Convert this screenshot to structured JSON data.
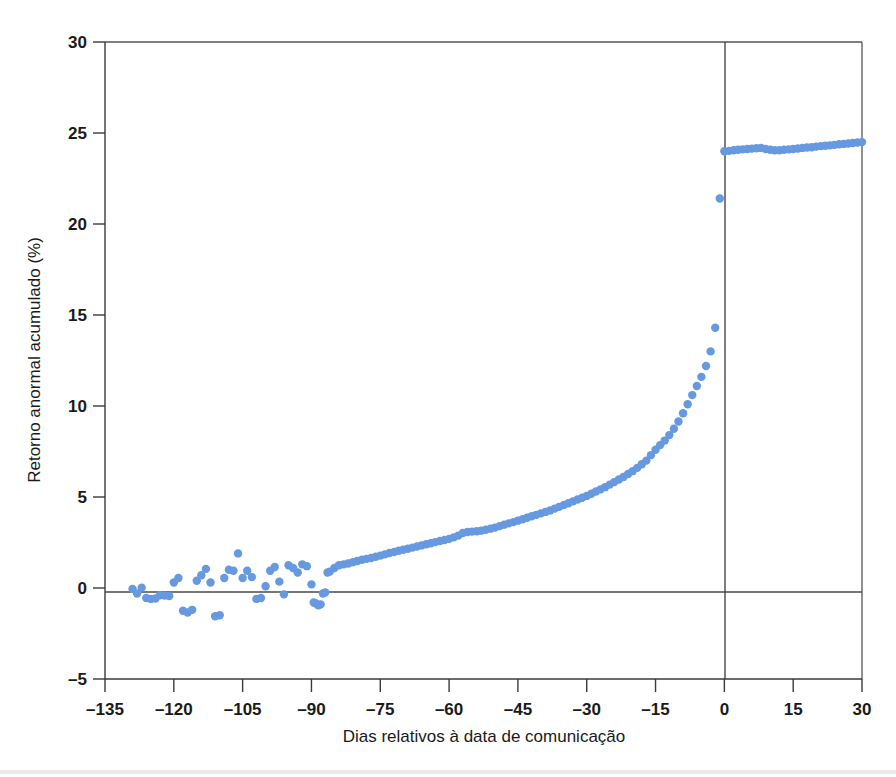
{
  "chart_data": {
    "type": "scatter",
    "title": "",
    "xlabel": "Dias relativos à data de comunicação",
    "ylabel": "Retorno anormal acumulado (%)",
    "xlim": [
      -135,
      30
    ],
    "ylim": [
      -5,
      30
    ],
    "xticks": [
      -135,
      -120,
      -105,
      -90,
      -75,
      -60,
      -45,
      -30,
      -15,
      0,
      15,
      30
    ],
    "xtick_labels": [
      "–135",
      "–120",
      "–105",
      "–90",
      "–75",
      "–60",
      "–45",
      "–30",
      "–15",
      "0",
      "15",
      "30"
    ],
    "yticks": [
      -5,
      0,
      5,
      10,
      15,
      20,
      25,
      30
    ],
    "ytick_labels": [
      "–5",
      "0",
      "5",
      "10",
      "15",
      "20",
      "25",
      "30"
    ],
    "grid": false,
    "legend": "none",
    "marker_color": "#6699e0",
    "marker_size": 4.2,
    "reference_lines": {
      "horizontal_zero_y": 0,
      "vertical_event_x": 0
    },
    "series": [
      {
        "name": "Retorno anormal acumulado",
        "points": [
          [
            -129,
            -0.05
          ],
          [
            -128,
            -0.3
          ],
          [
            -127,
            0.02
          ],
          [
            -126,
            -0.55
          ],
          [
            -125,
            -0.6
          ],
          [
            -124,
            -0.58
          ],
          [
            -123,
            -0.4
          ],
          [
            -122,
            -0.42
          ],
          [
            -121,
            -0.44
          ],
          [
            -120,
            0.3
          ],
          [
            -119,
            0.55
          ],
          [
            -118,
            -1.25
          ],
          [
            -117,
            -1.35
          ],
          [
            -116,
            -1.2
          ],
          [
            -115,
            0.4
          ],
          [
            -114,
            0.7
          ],
          [
            -113,
            1.05
          ],
          [
            -112,
            0.3
          ],
          [
            -111,
            -1.55
          ],
          [
            -110,
            -1.5
          ],
          [
            -109,
            0.55
          ],
          [
            -108,
            1.0
          ],
          [
            -107,
            0.95
          ],
          [
            -106,
            1.9
          ],
          [
            -105,
            0.55
          ],
          [
            -104,
            0.95
          ],
          [
            -103,
            0.6
          ],
          [
            -102,
            -0.6
          ],
          [
            -101,
            -0.55
          ],
          [
            -100,
            0.1
          ],
          [
            -99,
            0.95
          ],
          [
            -98,
            1.15
          ],
          [
            -97,
            0.35
          ],
          [
            -96,
            -0.35
          ],
          [
            -95,
            1.25
          ],
          [
            -94,
            1.1
          ],
          [
            -93,
            0.85
          ],
          [
            -92,
            1.3
          ],
          [
            -91,
            1.2
          ],
          [
            -90,
            0.2
          ],
          [
            -89.5,
            -0.8
          ],
          [
            -89,
            -0.85
          ],
          [
            -88.5,
            -0.95
          ],
          [
            -88,
            -0.9
          ],
          [
            -87.5,
            -0.3
          ],
          [
            -87,
            -0.25
          ],
          [
            -86.5,
            0.85
          ],
          [
            -86,
            0.9
          ],
          [
            -85,
            1.1
          ],
          [
            -84,
            1.25
          ],
          [
            -83,
            1.3
          ],
          [
            -82,
            1.35
          ],
          [
            -81,
            1.42
          ],
          [
            -80,
            1.48
          ],
          [
            -79,
            1.55
          ],
          [
            -78,
            1.6
          ],
          [
            -77,
            1.65
          ],
          [
            -76,
            1.72
          ],
          [
            -75,
            1.78
          ],
          [
            -74,
            1.85
          ],
          [
            -73,
            1.92
          ],
          [
            -72,
            1.98
          ],
          [
            -71,
            2.05
          ],
          [
            -70,
            2.1
          ],
          [
            -69,
            2.16
          ],
          [
            -68,
            2.22
          ],
          [
            -67,
            2.28
          ],
          [
            -66,
            2.34
          ],
          [
            -65,
            2.4
          ],
          [
            -64,
            2.46
          ],
          [
            -63,
            2.52
          ],
          [
            -62,
            2.58
          ],
          [
            -61,
            2.64
          ],
          [
            -60,
            2.7
          ],
          [
            -59,
            2.78
          ],
          [
            -58,
            2.88
          ],
          [
            -57,
            3.02
          ],
          [
            -56,
            3.08
          ],
          [
            -55,
            3.1
          ],
          [
            -54,
            3.12
          ],
          [
            -53,
            3.15
          ],
          [
            -52,
            3.2
          ],
          [
            -51,
            3.26
          ],
          [
            -50,
            3.32
          ],
          [
            -49,
            3.4
          ],
          [
            -48,
            3.48
          ],
          [
            -47,
            3.55
          ],
          [
            -46,
            3.62
          ],
          [
            -45,
            3.7
          ],
          [
            -44,
            3.78
          ],
          [
            -43,
            3.86
          ],
          [
            -42,
            3.94
          ],
          [
            -41,
            4.02
          ],
          [
            -40,
            4.1
          ],
          [
            -39,
            4.18
          ],
          [
            -38,
            4.26
          ],
          [
            -37,
            4.36
          ],
          [
            -36,
            4.46
          ],
          [
            -35,
            4.56
          ],
          [
            -34,
            4.66
          ],
          [
            -33,
            4.76
          ],
          [
            -32,
            4.86
          ],
          [
            -31,
            4.96
          ],
          [
            -30,
            5.06
          ],
          [
            -29,
            5.18
          ],
          [
            -28,
            5.3
          ],
          [
            -27,
            5.42
          ],
          [
            -26,
            5.54
          ],
          [
            -25,
            5.68
          ],
          [
            -24,
            5.82
          ],
          [
            -23,
            5.96
          ],
          [
            -22,
            6.1
          ],
          [
            -21,
            6.26
          ],
          [
            -20,
            6.42
          ],
          [
            -19,
            6.6
          ],
          [
            -18,
            6.8
          ],
          [
            -17,
            7.0
          ],
          [
            -16,
            7.3
          ],
          [
            -15,
            7.6
          ],
          [
            -14,
            7.85
          ],
          [
            -13,
            8.1
          ],
          [
            -12,
            8.4
          ],
          [
            -11,
            8.75
          ],
          [
            -10,
            9.15
          ],
          [
            -9,
            9.6
          ],
          [
            -8,
            10.1
          ],
          [
            -7,
            10.6
          ],
          [
            -6,
            11.1
          ],
          [
            -5,
            11.6
          ],
          [
            -4,
            12.2
          ],
          [
            -3,
            13.0
          ],
          [
            -2,
            14.3
          ],
          [
            -1,
            21.4
          ],
          [
            0,
            24.0
          ],
          [
            1,
            24.02
          ],
          [
            2,
            24.05
          ],
          [
            3,
            24.08
          ],
          [
            4,
            24.1
          ],
          [
            5,
            24.12
          ],
          [
            6,
            24.14
          ],
          [
            7,
            24.16
          ],
          [
            8,
            24.18
          ],
          [
            9,
            24.12
          ],
          [
            10,
            24.08
          ],
          [
            11,
            24.05
          ],
          [
            12,
            24.05
          ],
          [
            13,
            24.08
          ],
          [
            14,
            24.1
          ],
          [
            15,
            24.12
          ],
          [
            16,
            24.15
          ],
          [
            17,
            24.18
          ],
          [
            18,
            24.2
          ],
          [
            19,
            24.22
          ],
          [
            20,
            24.25
          ],
          [
            21,
            24.28
          ],
          [
            22,
            24.3
          ],
          [
            23,
            24.32
          ],
          [
            24,
            24.35
          ],
          [
            25,
            24.38
          ],
          [
            26,
            24.4
          ],
          [
            27,
            24.42
          ],
          [
            28,
            24.45
          ],
          [
            29,
            24.48
          ],
          [
            30,
            24.5
          ]
        ]
      }
    ]
  },
  "axes": {
    "x_title": "Dias relativos à data de comunicação",
    "y_title": "Retorno anormal acumulado (%)"
  }
}
